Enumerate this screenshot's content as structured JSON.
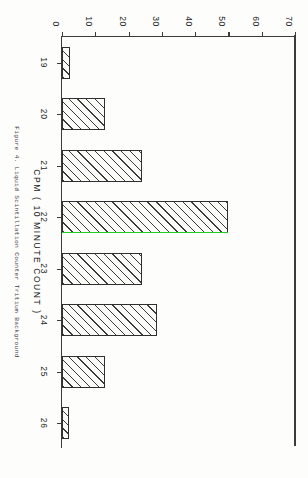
{
  "figure": {
    "caption": "Figure 4.  Liquid Scintillation Counter Tritium Background",
    "x_axis": {
      "title": "CPM ( 10 MINUTE COUNT )",
      "ticks": [
        "19",
        "20",
        "21",
        "22",
        "23",
        "24",
        "25",
        "26"
      ]
    },
    "y_axis": {
      "title": "",
      "ticks": [
        "0",
        "10",
        "20",
        "30",
        "40",
        "50",
        "60",
        "70"
      ]
    },
    "colors": {
      "axis": "#3b3b3b",
      "bar_edge": "#2f2f2f",
      "bar_hatch": "#3a3a3a",
      "highlight_green": "#22cc22",
      "background": "#fdfdfc"
    }
  },
  "chart_data": {
    "type": "bar",
    "title": "",
    "subtitle": "",
    "xlabel": "CPM ( 10 MINUTE COUNT )",
    "ylabel": "",
    "categories": [
      "19",
      "20",
      "21",
      "22",
      "23",
      "24",
      "25",
      "26"
    ],
    "values": [
      2.5,
      13,
      24,
      50,
      24,
      28.5,
      13,
      2
    ],
    "ylim": [
      0,
      70
    ],
    "yticks": [
      0,
      10,
      20,
      30,
      40,
      50,
      60,
      70
    ],
    "grid": false,
    "legend": null,
    "orientation": "vertical",
    "annotations": [
      {
        "type": "line",
        "color": "#22cc22",
        "at_category": "22",
        "note": "green marker line drawn along the right-hand edge of the tallest bar"
      }
    ]
  }
}
